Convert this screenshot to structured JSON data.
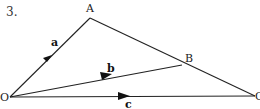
{
  "problem_number": "3.",
  "points": {
    "O": {
      "label": "O",
      "x": 10,
      "y": 97
    },
    "A": {
      "label": "A",
      "x": 90,
      "y": 18
    },
    "B": {
      "label": "B",
      "x": 182,
      "y": 65
    },
    "C": {
      "label": "C",
      "x": 255,
      "y": 96
    }
  },
  "vectors": [
    {
      "name": "a",
      "label": "a",
      "from": "O",
      "to": "A"
    },
    {
      "name": "b",
      "label": "b",
      "from": "O",
      "to": "B"
    },
    {
      "name": "c",
      "label": "c",
      "from": "O",
      "to": "C"
    }
  ],
  "segments": [
    {
      "from": "A",
      "to": "B"
    },
    {
      "from": "B",
      "to": "C"
    }
  ],
  "colors": {
    "line": "#222222",
    "background": "#ffffff"
  }
}
